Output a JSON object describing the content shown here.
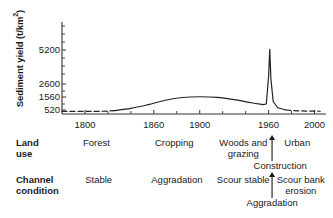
{
  "chart_data": {
    "type": "line",
    "title": "",
    "xlabel": "",
    "ylabel": "Sediment yield (t/km²)",
    "ylabel_main": "Sediment yield (t/km",
    "ylabel_sup": "2",
    "ylabel_tail": ")",
    "xlim": [
      1780,
      2010
    ],
    "ylim": [
      300,
      5600
    ],
    "grid": false,
    "legend": "none",
    "y_scale": "nonlinear-compressed",
    "yticks": [
      520,
      1560,
      2600,
      5200
    ],
    "ytick_labels": [
      "520",
      "1560",
      "2600",
      "5200"
    ],
    "xticks": [
      1800,
      1860,
      1900,
      1960,
      2000
    ],
    "xtick_labels": [
      "1800",
      "1860",
      "1900",
      "1960",
      "2000"
    ],
    "x_minor_ticks": [
      1820,
      1840,
      1880,
      1920,
      1940,
      1980
    ],
    "series": [
      {
        "name": "Sediment yield",
        "style": "dashed",
        "segment": "pre-settlement",
        "x": [
          1780,
          1800,
          1815,
          1825
        ],
        "values": [
          420,
          420,
          430,
          470
        ]
      },
      {
        "name": "Sediment yield",
        "style": "solid",
        "segment": "observed",
        "x": [
          1825,
          1840,
          1855,
          1870,
          1885,
          1900,
          1915,
          1930,
          1945,
          1955,
          1958,
          1960,
          1961,
          1962,
          1964,
          1968,
          1975
        ],
        "values": [
          470,
          650,
          950,
          1300,
          1520,
          1580,
          1530,
          1350,
          1100,
          950,
          1000,
          3200,
          5250,
          3000,
          1200,
          700,
          520
        ]
      },
      {
        "name": "Sediment yield",
        "style": "dashed",
        "segment": "projected",
        "x": [
          1975,
          1985,
          1995,
          2005
        ],
        "values": [
          520,
          460,
          440,
          430
        ]
      }
    ],
    "annotation_rows": [
      {
        "head": "Land use",
        "head_line1": "Land",
        "head_line2": "use",
        "items": [
          {
            "label": "Forest",
            "x_center": 1810
          },
          {
            "label": "Cropping",
            "x_center": 1878
          },
          {
            "label": "Woods and grazing",
            "line1": "Woods and",
            "line2": "grazing",
            "x_center": 1938
          },
          {
            "label": "Urban",
            "x_center": 1985
          }
        ],
        "arrow_label": "Construction",
        "arrow_x": 1963
      },
      {
        "head": "Channel condition",
        "head_line1": "Channel",
        "head_line2": "condition",
        "items": [
          {
            "label": "Stable",
            "x_center": 1812
          },
          {
            "label": "Aggradation",
            "x_center": 1880
          },
          {
            "label": "Scour stable",
            "x_center": 1938
          },
          {
            "label": "Scour bank erosion",
            "line1": "Scour bank",
            "line2": "erosion",
            "x_center": 1988
          }
        ],
        "arrow_label": "Aggradation",
        "arrow_x": 1963
      }
    ],
    "colors": {
      "line": "#222222",
      "axis": "#333333",
      "text": "#1a1a1a",
      "background": "#ffffff"
    }
  }
}
